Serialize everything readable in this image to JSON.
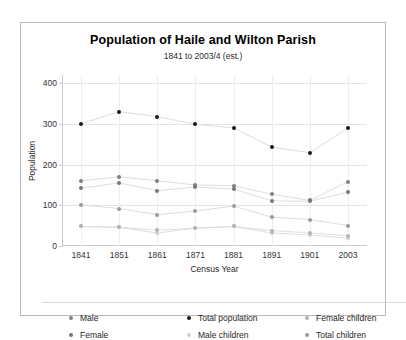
{
  "chart_data": {
    "type": "line",
    "title": "Population of Haile and Wilton Parish",
    "subtitle": "1841 to 2003/4 (est.)",
    "xlabel": "Census Year",
    "ylabel": "Population",
    "categories": [
      "1841",
      "1851",
      "1861",
      "1871",
      "1881",
      "1891",
      "1901",
      "2003"
    ],
    "yticks": [
      0,
      100,
      200,
      300,
      400
    ],
    "ylim": [
      0,
      420
    ],
    "grid": true,
    "legend_position": "bottom",
    "series": [
      {
        "name": "Male",
        "color": "#808080",
        "values": [
          160,
          170,
          160,
          150,
          148,
          127,
          112,
          158
        ]
      },
      {
        "name": "Female",
        "color": "#777777",
        "values": [
          142,
          155,
          136,
          145,
          140,
          111,
          110,
          132
        ]
      },
      {
        "name": "Total population",
        "color": "#1a1a1a",
        "values": [
          300,
          330,
          318,
          299,
          290,
          243,
          229,
          290
        ]
      },
      {
        "name": "Male children",
        "color": "#cfcfcf",
        "values": [
          48,
          46,
          32,
          44,
          48,
          32,
          27,
          19
        ]
      },
      {
        "name": "Female children",
        "color": "#b4b4b4",
        "values": [
          48,
          46,
          39,
          44,
          48,
          38,
          32,
          25
        ]
      },
      {
        "name": "Total children",
        "color": "#9a9a9a",
        "values": [
          101,
          92,
          77,
          86,
          98,
          71,
          65,
          50
        ]
      }
    ]
  }
}
